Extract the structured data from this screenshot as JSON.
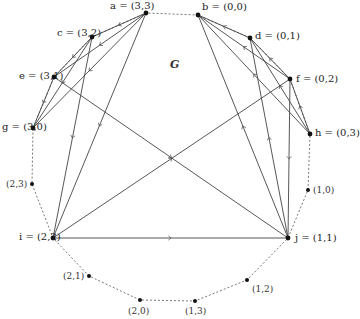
{
  "graph": {
    "title": "G",
    "colors": {
      "line": "#444444",
      "node": "#111111",
      "circle": "#555555"
    },
    "nodes": [
      {
        "id": "a",
        "label": "a = (3,3)",
        "x": 146,
        "y": 13,
        "lx": 110,
        "ly": 1
      },
      {
        "id": "b",
        "label": "b = (0,0)",
        "x": 198,
        "y": 15,
        "lx": 202,
        "ly": 2
      },
      {
        "id": "c",
        "label": "c = (3,2)",
        "x": 92,
        "y": 37,
        "lx": 57,
        "ly": 28
      },
      {
        "id": "d",
        "label": "d = (0,1)",
        "x": 250,
        "y": 38,
        "lx": 255,
        "ly": 31
      },
      {
        "id": "e",
        "label": "e = (3,1)",
        "x": 54,
        "y": 77,
        "lx": 19,
        "ly": 71
      },
      {
        "id": "f",
        "label": "f = (0,2)",
        "x": 290,
        "y": 79,
        "lx": 296,
        "ly": 74
      },
      {
        "id": "g",
        "label": "g = (3,0)",
        "x": 33,
        "y": 128,
        "lx": 2,
        "ly": 122
      },
      {
        "id": "h",
        "label": "h = (0,3)",
        "x": 310,
        "y": 134,
        "lx": 315,
        "ly": 128
      },
      {
        "id": "i",
        "label": "i = (2,2)",
        "x": 53,
        "y": 238,
        "lx": 19,
        "ly": 232
      },
      {
        "id": "j",
        "label": "j = (1,1)",
        "x": 288,
        "y": 238,
        "lx": 295,
        "ly": 233
      }
    ],
    "minor_nodes": [
      {
        "label": "(2,3)",
        "x": 32,
        "y": 184,
        "lx": 6,
        "ly": 179
      },
      {
        "label": "(1,0)",
        "x": 308,
        "y": 190,
        "lx": 313,
        "ly": 185
      },
      {
        "label": "(2,1)",
        "x": 89,
        "y": 276,
        "lx": 63,
        "ly": 271
      },
      {
        "label": "(2,0)",
        "x": 140,
        "y": 300,
        "lx": 128,
        "ly": 306
      },
      {
        "label": "(1,3)",
        "x": 195,
        "y": 301,
        "lx": 185,
        "ly": 306
      },
      {
        "label": "(1,2)",
        "x": 247,
        "y": 280,
        "lx": 252,
        "ly": 284
      }
    ],
    "edges": [
      {
        "from": "a",
        "to": "c"
      },
      {
        "from": "a",
        "to": "e"
      },
      {
        "from": "a",
        "to": "g"
      },
      {
        "from": "c",
        "to": "e"
      },
      {
        "from": "c",
        "to": "g"
      },
      {
        "from": "e",
        "to": "g"
      },
      {
        "from": "a",
        "to": "i"
      },
      {
        "from": "c",
        "to": "i"
      },
      {
        "from": "e",
        "to": "j"
      },
      {
        "from": "i",
        "to": "j"
      },
      {
        "from": "i",
        "to": "f"
      },
      {
        "from": "d",
        "to": "b"
      },
      {
        "from": "f",
        "to": "b"
      },
      {
        "from": "h",
        "to": "b"
      },
      {
        "from": "f",
        "to": "d"
      },
      {
        "from": "h",
        "to": "d"
      },
      {
        "from": "h",
        "to": "f"
      },
      {
        "from": "j",
        "to": "b"
      },
      {
        "from": "j",
        "to": "d"
      },
      {
        "from": "f",
        "to": "j"
      }
    ],
    "circle": {
      "cx": 170,
      "cy": 160,
      "rx": 142,
      "ry": 142
    }
  }
}
